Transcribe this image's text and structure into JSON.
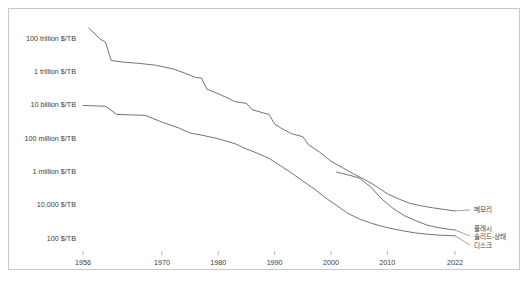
{
  "chart_data": {
    "type": "line",
    "title": "",
    "subtitle": "",
    "xlabel": "",
    "ylabel": "",
    "grid": false,
    "legend_position": "right-inline",
    "yscale": "log",
    "ylim": [
      100,
      600000000000000
    ],
    "xlim": [
      1954,
      2024
    ],
    "ytick_labels": [
      "100 trillion $/TB",
      "1 trillion $/TB",
      "10 billion $/TB",
      "100 million $/TB",
      "1 million $/TB",
      "10,000 $/TB",
      "100 $/TB"
    ],
    "ytick_values": [
      100000000000000,
      1000000000000,
      10000000000,
      100000000,
      1000000,
      10000,
      100
    ],
    "xtick_labels": [
      "1956",
      "1970",
      "1980",
      "1990",
      "2000",
      "2010",
      "2022"
    ],
    "xtick_values": [
      1956,
      1970,
      1980,
      1990,
      2000,
      2010,
      2022
    ],
    "series": [
      {
        "name": "memory",
        "label": "메모리",
        "color": "#5a5a5a",
        "points": [
          [
            1957,
            400000000000000
          ],
          [
            1959,
            90000000000000
          ],
          [
            1960,
            55000000000000
          ],
          [
            1961,
            4500000000000
          ],
          [
            1963,
            3600000000000
          ],
          [
            1966,
            3000000000000
          ],
          [
            1969,
            2300000000000
          ],
          [
            1972,
            1400000000000
          ],
          [
            1974,
            800000000000
          ],
          [
            1976,
            420000000000
          ],
          [
            1977,
            400000000000
          ],
          [
            1978,
            85000000000
          ],
          [
            1980,
            45000000000
          ],
          [
            1982,
            22000000000
          ],
          [
            1983,
            15000000000
          ],
          [
            1985,
            12000000000
          ],
          [
            1986,
            5000000000
          ],
          [
            1988,
            3200000000
          ],
          [
            1989,
            2600000000
          ],
          [
            1990,
            700000000
          ],
          [
            1991,
            420000000
          ],
          [
            1993,
            180000000
          ],
          [
            1995,
            120000000
          ],
          [
            1996,
            40000000
          ],
          [
            1998,
            14000000
          ],
          [
            2000,
            4000000
          ],
          [
            2002,
            1700000
          ],
          [
            2004,
            700000
          ],
          [
            2006,
            320000
          ],
          [
            2008,
            130000
          ],
          [
            2010,
            45000
          ],
          [
            2012,
            22000
          ],
          [
            2014,
            12000
          ],
          [
            2016,
            8500
          ],
          [
            2018,
            6500
          ],
          [
            2020,
            5200
          ],
          [
            2022,
            4200
          ]
        ]
      },
      {
        "name": "flash-ssd",
        "label_line1": "플래시",
        "label_line2": "솔리드-상태",
        "label": "플래시 솔리드-상태",
        "color": "#5a5a5a",
        "points": [
          [
            2001,
            900000
          ],
          [
            2003,
            620000
          ],
          [
            2005,
            400000
          ],
          [
            2007,
            120000
          ],
          [
            2009,
            22000
          ],
          [
            2011,
            6000
          ],
          [
            2013,
            2200
          ],
          [
            2015,
            1100
          ],
          [
            2017,
            600
          ],
          [
            2019,
            420
          ],
          [
            2021,
            330
          ],
          [
            2022,
            300
          ]
        ]
      },
      {
        "name": "disk",
        "label": "디스크",
        "color": "#5a5a5a",
        "points": [
          [
            1956,
            9000000000
          ],
          [
            1960,
            8000000000
          ],
          [
            1962,
            2600000000
          ],
          [
            1965,
            2400000000
          ],
          [
            1967,
            2300000000
          ],
          [
            1970,
            900000000
          ],
          [
            1973,
            400000000
          ],
          [
            1975,
            200000000
          ],
          [
            1977,
            150000000
          ],
          [
            1980,
            90000000
          ],
          [
            1983,
            45000000
          ],
          [
            1985,
            22000000
          ],
          [
            1987,
            12000000
          ],
          [
            1989,
            6000000
          ],
          [
            1991,
            2200000
          ],
          [
            1993,
            800000
          ],
          [
            1995,
            260000
          ],
          [
            1997,
            90000
          ],
          [
            1999,
            26000
          ],
          [
            2001,
            9000
          ],
          [
            2003,
            3000
          ],
          [
            2005,
            1400
          ],
          [
            2007,
            800
          ],
          [
            2009,
            500
          ],
          [
            2011,
            350
          ],
          [
            2013,
            260
          ],
          [
            2015,
            200
          ],
          [
            2017,
            170
          ],
          [
            2019,
            150
          ],
          [
            2021,
            140
          ],
          [
            2022,
            135
          ]
        ]
      }
    ]
  }
}
